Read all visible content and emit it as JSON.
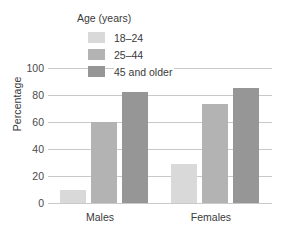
{
  "chart_data": {
    "type": "bar",
    "title": "",
    "xlabel": "",
    "ylabel": "Percentage",
    "ylim": [
      0,
      100
    ],
    "yticks": [
      0,
      20,
      40,
      60,
      80,
      100
    ],
    "grid": true,
    "legend_position": "top-center-overlay",
    "legend_title": "Age (years)",
    "categories": [
      "Males",
      "Females"
    ],
    "series": [
      {
        "name": "18–24",
        "color": "#d9d9d9",
        "values": [
          10,
          29
        ]
      },
      {
        "name": "25–44",
        "color": "#b3b3b3",
        "values": [
          60,
          73
        ]
      },
      {
        "name": "45 and older",
        "color": "#969696",
        "values": [
          82,
          85
        ]
      }
    ]
  },
  "axis": {
    "y_title": "Percentage",
    "y_tick_labels": [
      "100",
      "80",
      "60",
      "40",
      "20",
      "0"
    ],
    "x_tick_labels": [
      "Males",
      "Females"
    ]
  },
  "legend": {
    "title": "Age (years)",
    "items": [
      {
        "label": "18–24"
      },
      {
        "label": "25–44"
      },
      {
        "label": "45 and older"
      }
    ]
  }
}
